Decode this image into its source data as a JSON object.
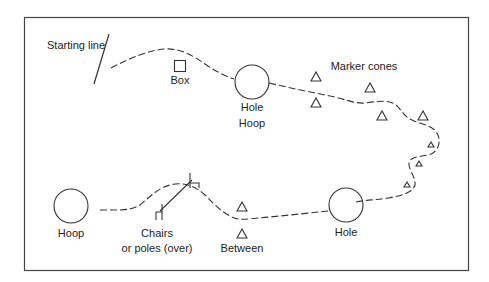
{
  "diagram": {
    "stroke_color": "#333333",
    "labels": {
      "starting_line": "Starting line",
      "box": "Box",
      "hole_hoop_1": "Hole",
      "hole_hoop_2": "Hoop",
      "marker_cones": "Marker cones",
      "hole": "Hole",
      "between": "Between",
      "chairs_1": "Chairs",
      "chairs_2": "or poles (over)",
      "hoop": "Hoop"
    },
    "obstacles": [
      {
        "type": "starting-line",
        "label": "Starting line"
      },
      {
        "type": "box",
        "label": "Box"
      },
      {
        "type": "hole-hoop",
        "label": "Hole Hoop"
      },
      {
        "type": "marker-cones",
        "label": "Marker cones",
        "count": 8
      },
      {
        "type": "hole",
        "label": "Hole"
      },
      {
        "type": "between-cones",
        "label": "Between",
        "count": 2
      },
      {
        "type": "chairs-or-poles",
        "label": "Chairs or poles (over)"
      },
      {
        "type": "hoop",
        "label": "Hoop"
      }
    ]
  }
}
